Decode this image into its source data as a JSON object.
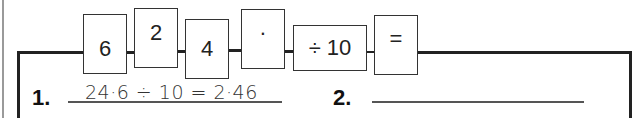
{
  "flow": {
    "boxes": [
      {
        "label": "6"
      },
      {
        "label": "2"
      },
      {
        "label": "4"
      },
      {
        "label": "·"
      },
      {
        "label": "÷ 10"
      },
      {
        "label": "="
      }
    ]
  },
  "questions": [
    {
      "number": "1.",
      "answer": "24·6 ÷ 10 = 2·46"
    },
    {
      "number": "2.",
      "answer": ""
    }
  ]
}
